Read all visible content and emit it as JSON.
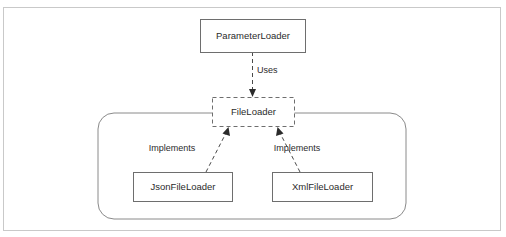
{
  "diagram": {
    "type": "uml-class-diagram",
    "colors": {
      "background": "#ffffff",
      "frame_border": "#c9c9c9",
      "node_border": "#6e6e6e",
      "group_border": "#8a8a8a",
      "edge": "#4a4a4a",
      "text": "#2b2b2b"
    },
    "nodes": [
      {
        "id": "parameter-loader",
        "label": "ParameterLoader",
        "style": "solid",
        "x": 200,
        "y": 19,
        "w": 105,
        "h": 33
      },
      {
        "id": "file-loader",
        "label": "FileLoader",
        "style": "dashed",
        "x": 212,
        "y": 97,
        "w": 82,
        "h": 29
      },
      {
        "id": "json-file-loader",
        "label": "JsonFileLoader",
        "style": "solid",
        "x": 133,
        "y": 172,
        "w": 99,
        "h": 29
      },
      {
        "id": "xml-file-loader",
        "label": "XmlFileLoader",
        "style": "solid",
        "x": 272,
        "y": 172,
        "w": 100,
        "h": 29
      }
    ],
    "group": {
      "id": "implementation-group",
      "x": 98,
      "y": 113,
      "w": 308,
      "h": 106,
      "radius": 16
    },
    "edges": [
      {
        "id": "uses-edge",
        "from": "parameter-loader",
        "to": "file-loader",
        "label": "Uses",
        "label_x": 255,
        "label_y": 70,
        "style": "dashed-arrow"
      },
      {
        "id": "implements-edge-json",
        "from": "json-file-loader",
        "to": "file-loader",
        "label": "Implements",
        "label_x": 172,
        "label_y": 148,
        "style": "dashed-arrow"
      },
      {
        "id": "implements-edge-xml",
        "from": "xml-file-loader",
        "to": "file-loader",
        "label": "Implements",
        "label_x": 268,
        "label_y": 148,
        "style": "dashed-arrow"
      }
    ]
  }
}
